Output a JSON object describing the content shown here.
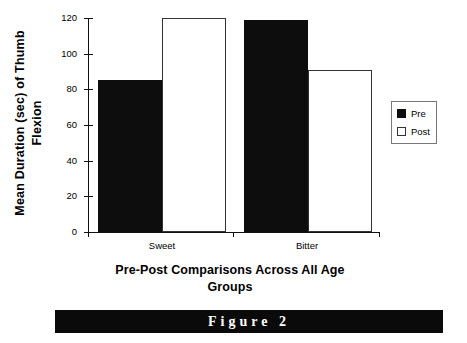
{
  "chart_data": {
    "type": "bar",
    "title": "",
    "categories": [
      "Sweet",
      "Bitter"
    ],
    "series": [
      {
        "name": "Pre",
        "values": [
          85,
          119
        ],
        "color": "#0d0d0d",
        "fill": "solid"
      },
      {
        "name": "Post",
        "values": [
          120,
          91
        ],
        "color": "#ffffff",
        "fill": "outline"
      }
    ],
    "xlabel": "Pre-Post Comparisons Across All Age Groups",
    "ylabel": "Mean Duration (sec) of Thumb Flexion",
    "ylim": [
      0,
      120
    ],
    "yticks": [
      0,
      20,
      40,
      60,
      80,
      100,
      120
    ],
    "ytick_labels": [
      "0",
      "20",
      "40",
      "60",
      "80",
      "100",
      "120"
    ],
    "grid": false,
    "legend_position": "right"
  },
  "axes": {
    "y_title_line1": "Mean Duration (sec) of  Thumb",
    "y_title_line2": "Flexion",
    "x_title_line1": "Pre-Post Comparisons Across All Age",
    "x_title_line2": "Groups"
  },
  "legend": {
    "entries": [
      {
        "label": "Pre"
      },
      {
        "label": "Post"
      }
    ]
  },
  "caption": {
    "text": "Figure 2"
  }
}
